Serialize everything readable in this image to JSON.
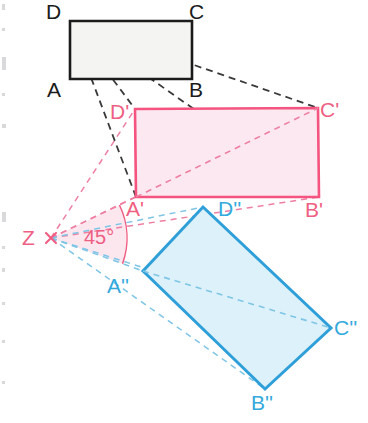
{
  "figure": {
    "width": 368,
    "height": 423,
    "background": "#ffffff"
  },
  "colors": {
    "black_stroke": "#1b1b1b",
    "black_fill": "#f4f4f2",
    "pink_stroke": "#f4547f",
    "pink_fill": "#fbe8f0",
    "pink_dash": "#ef7fa2",
    "blue_stroke": "#2e9fd8",
    "blue_fill": "#ddf1fa",
    "blue_dash": "#7ec5e6",
    "angle_wedge_fill": "#fbe3ec",
    "margin_tick": "#b9b9bd"
  },
  "shapes": {
    "original_rectangle": {
      "name": "ABCD",
      "stroke": "#1b1b1b",
      "fill": "#f4f4f2",
      "stroke_width": 2.6,
      "points": [
        [
          70,
          21
        ],
        [
          192,
          21
        ],
        [
          192,
          79
        ],
        [
          70,
          79
        ]
      ],
      "vertices": {
        "D": [
          70,
          21
        ],
        "C": [
          192,
          21
        ],
        "B": [
          192,
          79
        ],
        "A": [
          70,
          79
        ]
      }
    },
    "first_image_rectangle": {
      "name": "A'B'C'D'",
      "stroke": "#f4547f",
      "fill": "#fbe8f0",
      "stroke_width": 2.6,
      "points": [
        [
          135,
          109
        ],
        [
          318,
          108
        ],
        [
          319,
          197
        ],
        [
          136,
          197
        ]
      ],
      "vertices": {
        "D1": [
          135,
          109
        ],
        "C1": [
          318,
          108
        ],
        "B1": [
          319,
          197
        ],
        "A1": [
          136,
          197
        ]
      }
    },
    "second_image_rectangle": {
      "name": "A''B''C''D''",
      "stroke": "#2e9fd8",
      "fill": "#ddf1fa",
      "stroke_width": 3.0,
      "points": [
        [
          203,
          207
        ],
        [
          331,
          328
        ],
        [
          265,
          389
        ],
        [
          143,
          271
        ]
      ],
      "vertices": {
        "D2": [
          203,
          207
        ],
        "C2": [
          331,
          328
        ],
        "B2": [
          265,
          389
        ],
        "A2": [
          143,
          271
        ]
      }
    }
  },
  "centre": {
    "label": "Z",
    "point": [
      51,
      238
    ],
    "marker": "cross-marker",
    "label_position": [
      22,
      227
    ]
  },
  "angle": {
    "label": "45°",
    "value": 45,
    "unit": "degrees",
    "arc_radius": 76,
    "label_position": [
      84,
      226
    ]
  },
  "construction_rays": {
    "from_original_vertex_D": {
      "description": "black dashed rays drawn from D of rectangle ABCD",
      "color": "#3a3a3a",
      "dash": "7 5",
      "origin": [
        70,
        22
      ],
      "targets": [
        [
          135,
          109
        ],
        [
          136,
          197
        ],
        [
          318,
          108
        ],
        [
          319,
          197
        ],
        [
          192,
          79
        ]
      ]
    },
    "from_centre_Z_pink": {
      "description": "pink dashed rays from Z to the first image rectangle",
      "color": "#ef7fa2",
      "dash": "6 5",
      "origin": [
        51,
        238
      ],
      "targets": [
        [
          135,
          109
        ],
        [
          136,
          197
        ],
        [
          318,
          108
        ],
        [
          319,
          197
        ]
      ]
    },
    "from_centre_Z_blue": {
      "description": "blue dashed rays from Z to the second image rectangle",
      "color": "#7ec5e6",
      "dash": "6 5",
      "origin": [
        51,
        238
      ],
      "targets": [
        [
          203,
          207
        ],
        [
          143,
          271
        ],
        [
          331,
          328
        ],
        [
          265,
          389
        ]
      ]
    }
  },
  "labels": {
    "original": [
      {
        "text": "D",
        "name": "vertex-label-D",
        "x": 46,
        "y": 1,
        "color": "black"
      },
      {
        "text": "C",
        "name": "vertex-label-C",
        "x": 189,
        "y": 1,
        "color": "black"
      },
      {
        "text": "A",
        "name": "vertex-label-A",
        "x": 47,
        "y": 79,
        "color": "black"
      },
      {
        "text": "B",
        "name": "vertex-label-B",
        "x": 189,
        "y": 79,
        "color": "black"
      }
    ],
    "first_image": [
      {
        "text": "D'",
        "name": "vertex-label-D-prime",
        "x": 110,
        "y": 101,
        "color": "pink"
      },
      {
        "text": "C'",
        "name": "vertex-label-C-prime",
        "x": 320,
        "y": 99,
        "color": "pink"
      },
      {
        "text": "A'",
        "name": "vertex-label-A-prime",
        "x": 126,
        "y": 198,
        "color": "pink"
      },
      {
        "text": "B'",
        "name": "vertex-label-B-prime",
        "x": 305,
        "y": 199,
        "color": "pink"
      }
    ],
    "second_image": [
      {
        "text": "D''",
        "name": "vertex-label-D-double-prime",
        "x": 218,
        "y": 198,
        "color": "blue"
      },
      {
        "text": "C''",
        "name": "vertex-label-C-double-prime",
        "x": 334,
        "y": 317,
        "color": "blue"
      },
      {
        "text": "A''",
        "name": "vertex-label-A-double-prime",
        "x": 107,
        "y": 275,
        "color": "blue"
      },
      {
        "text": "B''",
        "name": "vertex-label-B-double-prime",
        "x": 251,
        "y": 392,
        "color": "blue"
      }
    ]
  },
  "margin_ticks": [
    {
      "y": 4,
      "w": 3,
      "h": 6
    },
    {
      "y": 28,
      "w": 3,
      "h": 3
    },
    {
      "y": 57,
      "w": 4,
      "h": 13
    },
    {
      "y": 93,
      "w": 3,
      "h": 3
    },
    {
      "y": 124,
      "w": 4,
      "h": 4
    },
    {
      "y": 212,
      "w": 4,
      "h": 10
    },
    {
      "y": 246,
      "w": 3,
      "h": 3
    },
    {
      "y": 268,
      "w": 3,
      "h": 4
    },
    {
      "y": 302,
      "w": 3,
      "h": 3
    },
    {
      "y": 340,
      "w": 3,
      "h": 3
    },
    {
      "y": 381,
      "w": 3,
      "h": 3
    }
  ]
}
